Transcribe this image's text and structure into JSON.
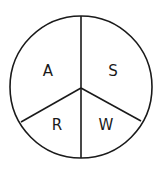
{
  "diagram": {
    "type": "circle-divided-into-sectors",
    "stroke_color": "#1a1a1a",
    "background": "#ffffff",
    "sectors": [
      {
        "id": "a",
        "label": "A",
        "position": "upper-left"
      },
      {
        "id": "s",
        "label": "S",
        "position": "upper-right"
      },
      {
        "id": "r",
        "label": "R",
        "position": "lower-left"
      },
      {
        "id": "w",
        "label": "W",
        "position": "lower-right"
      }
    ]
  }
}
